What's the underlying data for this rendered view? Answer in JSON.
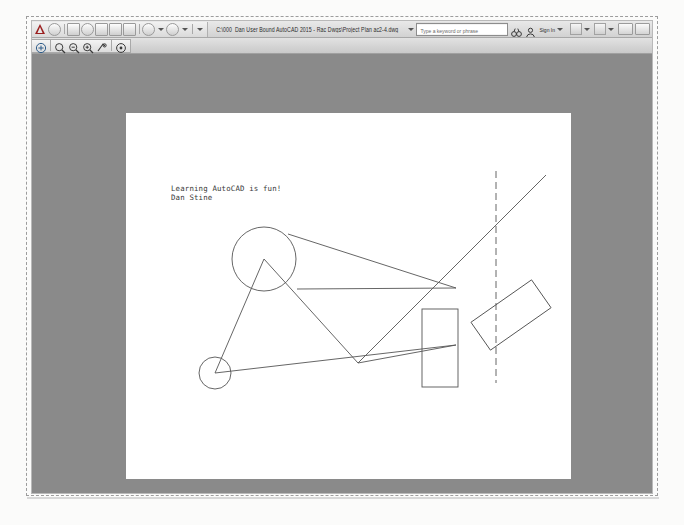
{
  "window": {
    "title": "C:\\000_Dan User Bound AutoCAD 2015 - Rac Dwgs\\Project Plan ac2-4.dwg",
    "app_name": "AutoCAD"
  },
  "quick_access_toolbar": {
    "logo_label": "A",
    "items": [
      {
        "name": "workspace-switch",
        "label": ""
      },
      {
        "name": "new-drawing",
        "label": ""
      },
      {
        "name": "open-drawing",
        "label": ""
      },
      {
        "name": "save-drawing",
        "label": ""
      },
      {
        "name": "save-as-drawing",
        "label": ""
      },
      {
        "name": "plot",
        "label": ""
      },
      {
        "name": "undo",
        "label": ""
      },
      {
        "name": "redo",
        "label": ""
      },
      {
        "name": "customize",
        "label": ""
      }
    ]
  },
  "info_center": {
    "search_placeholder": "Type a keyword or phrase",
    "search_value": "",
    "sign_in_label": "Sign In",
    "search_icon": "binoculars-icon",
    "account_icon": "person-icon",
    "exchange_icon": "exchange-app-icon",
    "help_icon": "question-mark-icon"
  },
  "window_controls": {
    "minimize_label": "_",
    "restore_label": "□",
    "close_label": "×"
  },
  "zoom_toolbar": {
    "items": [
      {
        "name": "pan-realtime",
        "icon": "pan-hand-icon",
        "label": "Pan"
      },
      {
        "name": "zoom-realtime",
        "icon": "zoom-realtime-icon",
        "label": "Zoom Realtime"
      },
      {
        "name": "zoom-window",
        "icon": "zoom-window-icon",
        "label": "Zoom Window"
      },
      {
        "name": "zoom-scale",
        "icon": "zoom-scale-icon",
        "label": "Zoom Scale"
      },
      {
        "name": "zoom-previous",
        "icon": "zoom-previous-icon",
        "label": "Zoom Previous"
      },
      {
        "name": "zoom-extents",
        "icon": "zoom-extents-icon",
        "label": "Zoom Extents"
      }
    ]
  },
  "drawing": {
    "text_line_1": "Learning AutoCAD is fun!",
    "text_line_2": "Dan Stine",
    "line_color": "#555555",
    "paper_color": "#ffffff",
    "backdrop_color": "#8a8a8a",
    "entities": [
      {
        "name": "large-circle",
        "type": "circle",
        "cx": 138,
        "cy": 146,
        "r": 32
      },
      {
        "name": "small-circle",
        "type": "circle",
        "cx": 89,
        "cy": 260,
        "r": 16
      },
      {
        "name": "triangle-apex-line-left",
        "type": "line",
        "x1": 138,
        "y1": 146,
        "x2": 89,
        "y2": 260
      },
      {
        "name": "triangle-apex-line-right",
        "type": "line",
        "x1": 138,
        "y1": 146,
        "x2": 232,
        "y2": 250
      },
      {
        "name": "chord-line-bottom",
        "type": "line",
        "x1": 89,
        "y1": 260,
        "x2": 330,
        "y2": 232
      },
      {
        "name": "chord-line-mid",
        "type": "line",
        "x1": 171,
        "y1": 176,
        "x2": 330,
        "y2": 175
      },
      {
        "name": "chord-line-top",
        "type": "line",
        "x1": 162,
        "y1": 121,
        "x2": 330,
        "y2": 175
      },
      {
        "name": "spoke-line-lower",
        "type": "line",
        "x1": 232,
        "y1": 250,
        "x2": 330,
        "y2": 232
      },
      {
        "name": "diagonal-long-line",
        "type": "line",
        "x1": 232,
        "y1": 250,
        "x2": 420,
        "y2": 62
      },
      {
        "name": "vertical-dashed-line",
        "type": "dashed-line",
        "x1": 370,
        "y1": 58,
        "x2": 370,
        "y2": 270
      },
      {
        "name": "upright-rectangle",
        "type": "rect",
        "x": 296,
        "y": 196,
        "w": 36,
        "h": 78
      },
      {
        "name": "rotated-rectangle",
        "type": "rotated-rect",
        "cx": 385,
        "cy": 202,
        "w": 74,
        "h": 34,
        "angle": -35
      }
    ]
  }
}
